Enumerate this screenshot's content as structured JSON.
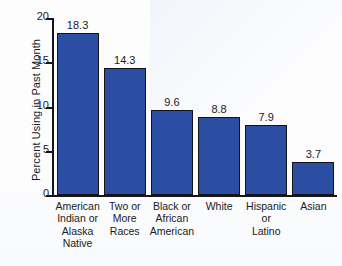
{
  "chart_data": {
    "type": "bar",
    "title": "",
    "xlabel": "",
    "ylabel": "Percent Using in Past Month",
    "ylim": [
      0,
      20
    ],
    "yticks": [
      0,
      5,
      10,
      15,
      20
    ],
    "ytick_labels": [
      "0",
      "5",
      "10",
      "15",
      "20"
    ],
    "grid": false,
    "legend": null,
    "bar_color": "#2b4ea2",
    "bar_edge_color": "#121217",
    "categories": [
      "American Indian or Alaska Native",
      "Two or More Races",
      "Black or African American",
      "White",
      "Hispanic or Latino",
      "Asian"
    ],
    "category_lines": [
      [
        "American",
        "Indian or",
        "Alaska",
        "Native"
      ],
      [
        "Two or",
        "More",
        "Races"
      ],
      [
        "Black or",
        "African",
        "American"
      ],
      [
        "White"
      ],
      [
        "Hispanic",
        "or",
        "Latino"
      ],
      [
        "Asian"
      ]
    ],
    "values": [
      18.3,
      14.3,
      9.6,
      8.8,
      7.9,
      3.7
    ],
    "value_labels": [
      "18.3",
      "14.3",
      "9.6",
      "8.8",
      "7.9",
      "3.7"
    ]
  }
}
